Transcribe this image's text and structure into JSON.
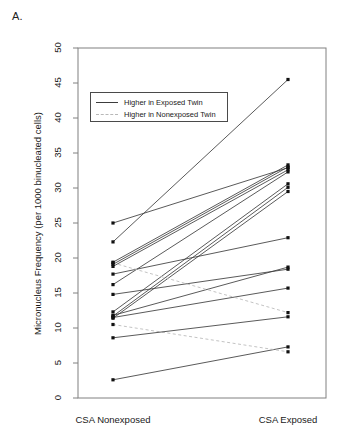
{
  "panel": {
    "label": "A."
  },
  "axes": {
    "ylabel": "Micronucleus Frequency (per 1000 binucleated cells)",
    "yticks": [
      0,
      5,
      10,
      15,
      20,
      25,
      30,
      35,
      40,
      45,
      50
    ],
    "xticks": [
      "CSA Nonexposed",
      "CSA Exposed"
    ]
  },
  "legend": {
    "entries": [
      {
        "label": "Higher in Exposed Twin",
        "style": "solid",
        "color": "#3c3c3c"
      },
      {
        "label": "Higher in Nonexposed Twin",
        "style": "dashed",
        "color": "#b8b8b8"
      }
    ]
  },
  "colors": {
    "increase_line": "#3c3c3c",
    "decrease_line": "#b8b8b8",
    "point": "#111111",
    "axis": "#808080"
  },
  "chart_data": {
    "type": "line",
    "title": "",
    "subtitle": "",
    "xlabel": "",
    "ylabel": "Micronucleus Frequency (per 1000 binucleated cells)",
    "categories": [
      "CSA Nonexposed",
      "CSA Exposed"
    ],
    "xtick_positions": [
      0,
      1
    ],
    "ylim": [
      0,
      50
    ],
    "yticks": [
      0,
      5,
      10,
      15,
      20,
      25,
      30,
      35,
      40,
      45,
      50
    ],
    "grid": false,
    "legend_position": "upper-left-inside",
    "paired": true,
    "series": [
      {
        "name": "pair-1",
        "values": [
          22.3,
          45.5
        ],
        "direction": "increase"
      },
      {
        "name": "pair-2",
        "values": [
          19.4,
          33.3
        ],
        "direction": "increase"
      },
      {
        "name": "pair-3",
        "values": [
          19.1,
          33.0
        ],
        "direction": "increase"
      },
      {
        "name": "pair-4",
        "values": [
          18.8,
          32.6
        ],
        "direction": "increase"
      },
      {
        "name": "pair-5",
        "values": [
          16.2,
          32.3
        ],
        "direction": "increase"
      },
      {
        "name": "pair-6",
        "values": [
          12.3,
          30.6
        ],
        "direction": "increase"
      },
      {
        "name": "pair-7",
        "values": [
          11.7,
          30.1
        ],
        "direction": "increase"
      },
      {
        "name": "pair-8",
        "values": [
          11.4,
          29.5
        ],
        "direction": "increase"
      },
      {
        "name": "pair-9",
        "values": [
          17.7,
          22.9
        ],
        "direction": "increase"
      },
      {
        "name": "pair-10",
        "values": [
          11.8,
          18.7
        ],
        "direction": "increase"
      },
      {
        "name": "pair-11",
        "values": [
          14.8,
          18.4
        ],
        "direction": "increase"
      },
      {
        "name": "pair-12",
        "values": [
          11.5,
          15.7
        ],
        "direction": "increase"
      },
      {
        "name": "pair-13",
        "values": [
          2.6,
          7.3
        ],
        "direction": "increase"
      },
      {
        "name": "pair-14",
        "values": [
          19.3,
          12.2
        ],
        "direction": "decrease"
      },
      {
        "name": "pair-15",
        "values": [
          10.5,
          6.6
        ],
        "direction": "decrease"
      },
      {
        "name": "pair-16",
        "values": [
          8.6,
          11.6
        ],
        "direction": "increase"
      },
      {
        "name": "pair-17",
        "values": [
          25.0,
          32.9
        ],
        "direction": "increase"
      }
    ],
    "left_points": [
      25.0,
      22.3,
      19.4,
      19.3,
      19.1,
      18.8,
      17.7,
      16.2,
      14.8,
      12.3,
      11.8,
      11.7,
      11.5,
      11.4,
      10.5,
      8.6,
      2.6
    ],
    "right_points": [
      45.5,
      33.3,
      33.0,
      32.9,
      32.6,
      32.3,
      30.6,
      30.1,
      29.5,
      22.9,
      18.7,
      18.4,
      15.7,
      12.2,
      11.6,
      7.3,
      6.6
    ]
  }
}
